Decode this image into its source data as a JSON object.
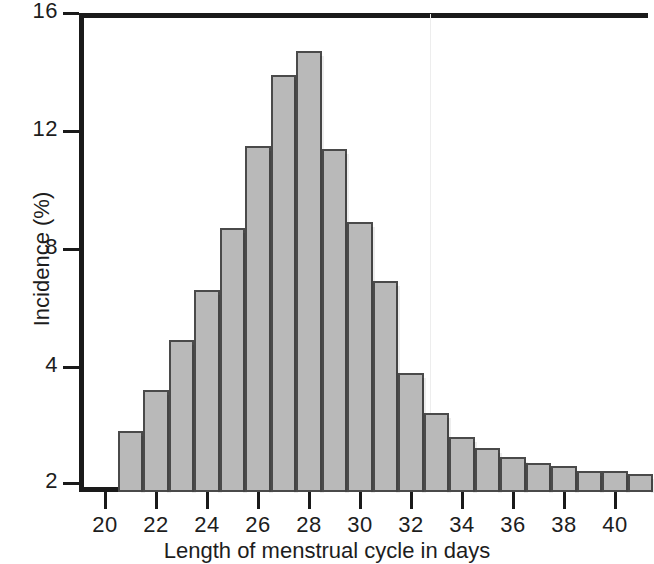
{
  "chart_data": {
    "type": "bar",
    "title": "",
    "xlabel": "Length of menstrual cycle in days",
    "ylabel": "Incidence (%)",
    "categories": [
      21,
      22,
      23,
      24,
      25,
      26,
      27,
      28,
      29,
      30,
      31,
      32,
      33,
      34,
      35,
      36,
      37,
      38,
      39,
      40,
      41
    ],
    "values": [
      2.9,
      3.6,
      4.9,
      6.6,
      8.7,
      11.5,
      13.9,
      14.7,
      11.4,
      8.9,
      6.9,
      3.9,
      3.2,
      2.8,
      2.6,
      2.45,
      2.35,
      2.3,
      2.2,
      2.2,
      2.15
    ],
    "ylim": [
      2,
      16
    ],
    "xlim": [
      19.4,
      41.8
    ],
    "yticks": [
      2,
      4,
      8,
      12,
      16
    ],
    "ytick_labels": [
      "2",
      "4",
      "8",
      "12",
      "16"
    ],
    "xticks": [
      20,
      22,
      24,
      26,
      28,
      30,
      32,
      34,
      36,
      38,
      40
    ],
    "xtick_labels": [
      "20",
      "22",
      "24",
      "26",
      "28",
      "30",
      "32",
      "34",
      "36",
      "38",
      "40"
    ],
    "grid": false,
    "legend": false,
    "bar_fill": "#b9b9b9",
    "bar_edge": "#4a4a4a",
    "axis_color": "#1a1a1a",
    "note_axis": "y-axis is broken: the 2-to-4 span uses the same pixel height as each 4-unit step above 4"
  }
}
